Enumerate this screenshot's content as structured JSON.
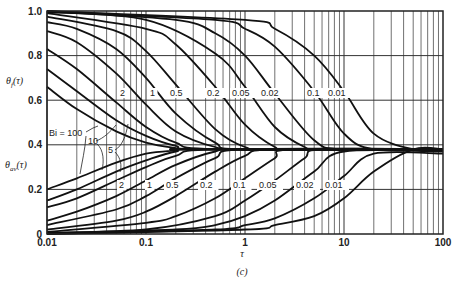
{
  "chart_data": {
    "type": "line",
    "title": "",
    "caption": "(c)",
    "xlabel": "τ",
    "ylabel_top": "θf(τ)",
    "ylabel_bottom": "θav(τ)",
    "xscale": "log",
    "xlim": [
      0.01,
      100
    ],
    "ylim": [
      0,
      1.0
    ],
    "grid": true,
    "x_ticks": [
      "0.01",
      "0.1",
      "1",
      "10",
      "100"
    ],
    "y_ticks": [
      "0",
      "0.2",
      "0.4",
      "0.6",
      "0.8",
      "1.0"
    ],
    "asymptote": 0.38,
    "series_groups": [
      {
        "name": "θf(τ)",
        "curve_labels": [
          "Bi = 100",
          "10",
          "5",
          "2",
          "1",
          "0.5",
          "0.2",
          "0.05",
          "0.02",
          "0.1",
          "0.01"
        ],
        "series": [
          {
            "name": "Bi=100",
            "x": [
              0.01,
              0.02,
              0.05,
              0.1,
              0.2,
              0.3
            ],
            "y": [
              0.66,
              0.56,
              0.46,
              0.41,
              0.385,
              0.38
            ]
          },
          {
            "name": "Bi=10",
            "x": [
              0.01,
              0.02,
              0.05,
              0.1,
              0.2,
              0.4
            ],
            "y": [
              0.74,
              0.64,
              0.51,
              0.44,
              0.395,
              0.38
            ]
          },
          {
            "name": "Bi=5",
            "x": [
              0.01,
              0.02,
              0.05,
              0.1,
              0.2,
              0.5
            ],
            "y": [
              0.83,
              0.74,
              0.59,
              0.48,
              0.41,
              0.38
            ]
          },
          {
            "name": "Bi=2",
            "x": [
              0.01,
              0.02,
              0.05,
              0.1,
              0.2,
              0.5,
              1
            ],
            "y": [
              0.91,
              0.86,
              0.72,
              0.58,
              0.46,
              0.39,
              0.38
            ]
          },
          {
            "name": "Bi=1",
            "x": [
              0.01,
              0.02,
              0.05,
              0.1,
              0.2,
              0.5,
              1
            ],
            "y": [
              0.95,
              0.92,
              0.83,
              0.7,
              0.54,
              0.41,
              0.38
            ]
          },
          {
            "name": "Bi=0.5",
            "x": [
              0.01,
              0.05,
              0.1,
              0.2,
              0.5,
              1,
              2
            ],
            "y": [
              0.975,
              0.91,
              0.82,
              0.67,
              0.47,
              0.39,
              0.38
            ]
          },
          {
            "name": "Bi=0.2",
            "x": [
              0.01,
              0.1,
              0.2,
              0.5,
              1,
              2,
              3
            ],
            "y": [
              0.99,
              0.92,
              0.85,
              0.66,
              0.49,
              0.39,
              0.38
            ]
          },
          {
            "name": "Bi=0.1",
            "x": [
              0.01,
              0.1,
              0.5,
              1,
              2,
              4,
              6
            ],
            "y": [
              0.995,
              0.96,
              0.81,
              0.66,
              0.48,
              0.39,
              0.38
            ]
          },
          {
            "name": "Bi=0.05",
            "x": [
              0.01,
              0.2,
              0.5,
              1,
              2,
              5,
              10
            ],
            "y": [
              0.998,
              0.96,
              0.9,
              0.8,
              0.63,
              0.42,
              0.38
            ]
          },
          {
            "name": "Bi=0.02",
            "x": [
              0.01,
              0.5,
              1,
              2,
              5,
              10,
              20
            ],
            "y": [
              0.999,
              0.96,
              0.92,
              0.84,
              0.64,
              0.45,
              0.38
            ]
          },
          {
            "name": "Bi=0.01",
            "x": [
              0.01,
              1,
              2,
              5,
              10,
              20,
              50
            ],
            "y": [
              1.0,
              0.96,
              0.92,
              0.8,
              0.64,
              0.45,
              0.38
            ]
          }
        ]
      },
      {
        "name": "θav(τ)",
        "curve_labels": [
          "2",
          "1",
          "0.5",
          "0.2",
          "0.1",
          "0.05",
          "0.02",
          "0.01"
        ],
        "series": [
          {
            "name": "Bi=100",
            "x": [
              0.01,
              0.02,
              0.05,
              0.1,
              0.2,
              0.3
            ],
            "y": [
              0.2,
              0.25,
              0.32,
              0.36,
              0.375,
              0.38
            ]
          },
          {
            "name": "Bi=10",
            "x": [
              0.01,
              0.02,
              0.05,
              0.1,
              0.2,
              0.4
            ],
            "y": [
              0.15,
              0.2,
              0.28,
              0.33,
              0.37,
              0.38
            ]
          },
          {
            "name": "Bi=5",
            "x": [
              0.01,
              0.02,
              0.05,
              0.1,
              0.2,
              0.5
            ],
            "y": [
              0.12,
              0.16,
              0.24,
              0.3,
              0.35,
              0.38
            ]
          },
          {
            "name": "Bi=2",
            "x": [
              0.01,
              0.02,
              0.05,
              0.1,
              0.2,
              0.5,
              1
            ],
            "y": [
              0.06,
              0.1,
              0.17,
              0.24,
              0.31,
              0.37,
              0.38
            ]
          },
          {
            "name": "Bi=1",
            "x": [
              0.01,
              0.05,
              0.1,
              0.2,
              0.5,
              1
            ],
            "y": [
              0.04,
              0.11,
              0.17,
              0.25,
              0.34,
              0.38
            ]
          },
          {
            "name": "Bi=0.5",
            "x": [
              0.01,
              0.05,
              0.1,
              0.2,
              0.5,
              1,
              2
            ],
            "y": [
              0.02,
              0.06,
              0.1,
              0.17,
              0.28,
              0.35,
              0.38
            ]
          },
          {
            "name": "Bi=0.2",
            "x": [
              0.01,
              0.1,
              0.2,
              0.5,
              1,
              2,
              3
            ],
            "y": [
              0.01,
              0.05,
              0.08,
              0.16,
              0.25,
              0.34,
              0.38
            ]
          },
          {
            "name": "Bi=0.1",
            "x": [
              0.01,
              0.1,
              0.5,
              1,
              2,
              4,
              6
            ],
            "y": [
              0.005,
              0.02,
              0.08,
              0.15,
              0.24,
              0.34,
              0.38
            ]
          },
          {
            "name": "Bi=0.05",
            "x": [
              0.01,
              0.2,
              0.5,
              1,
              2,
              5,
              10
            ],
            "y": [
              0.003,
              0.02,
              0.04,
              0.08,
              0.15,
              0.28,
              0.37
            ]
          },
          {
            "name": "Bi=0.02",
            "x": [
              0.01,
              0.5,
              1,
              2,
              5,
              10,
              20
            ],
            "y": [
              0.001,
              0.02,
              0.04,
              0.07,
              0.16,
              0.26,
              0.36
            ]
          },
          {
            "name": "Bi=0.01",
            "x": [
              0.01,
              1,
              2,
              5,
              10,
              20,
              50
            ],
            "y": [
              0.0,
              0.02,
              0.04,
              0.08,
              0.16,
              0.28,
              0.38
            ]
          }
        ]
      }
    ]
  },
  "labels": {
    "top_curves": [
      {
        "text": "2",
        "x": 120,
        "y": 96
      },
      {
        "text": "1",
        "x": 150,
        "y": 96
      },
      {
        "text": "0.5",
        "x": 170,
        "y": 96
      },
      {
        "text": "0.2",
        "x": 207,
        "y": 96
      },
      {
        "text": "0.05",
        "x": 232,
        "y": 96
      },
      {
        "text": "0.02",
        "x": 261,
        "y": 96
      },
      {
        "text": "0.1",
        "x": 307,
        "y": 96
      },
      {
        "text": "0.01",
        "x": 328,
        "y": 96
      }
    ],
    "bottom_curves": [
      {
        "text": "2",
        "x": 119,
        "y": 188
      },
      {
        "text": "1",
        "x": 147,
        "y": 188
      },
      {
        "text": "0.5",
        "x": 166,
        "y": 188
      },
      {
        "text": "0.2",
        "x": 200,
        "y": 188
      },
      {
        "text": "0.1",
        "x": 233,
        "y": 188
      },
      {
        "text": "0.05",
        "x": 259,
        "y": 188
      },
      {
        "text": "0.02",
        "x": 296,
        "y": 188
      },
      {
        "text": "0.01",
        "x": 325,
        "y": 188
      }
    ],
    "bi_100": "Bi = 100",
    "bi_10": "10",
    "bi_5": "5"
  }
}
